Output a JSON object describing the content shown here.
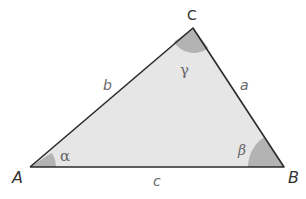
{
  "diagram": {
    "type": "triangle",
    "vertices": {
      "A": "A",
      "B": "B",
      "C": "C"
    },
    "sides": {
      "a": "a",
      "b": "b",
      "c": "c"
    },
    "angles": {
      "alpha": "α",
      "beta": "β",
      "gamma": "γ"
    },
    "colors": {
      "fill": "#e6e6e6",
      "stroke": "#2b2b2b",
      "angle_fill": "#b3b3b3",
      "label": "#333333"
    }
  }
}
